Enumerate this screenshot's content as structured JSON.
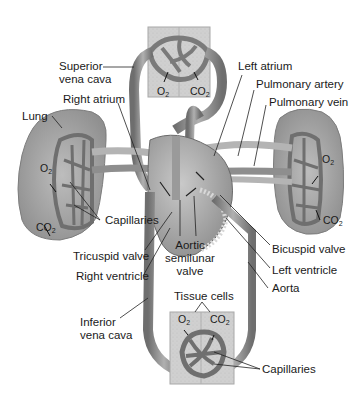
{
  "diagram": {
    "type": "circulatory-system",
    "labels": {
      "superior_vena_cava_1": "Superior",
      "superior_vena_cava_2": "vena cava",
      "right_atrium": "Right atrium",
      "lung": "Lung",
      "capillaries_lung": "Capillaries",
      "tricuspid_valve": "Tricuspid valve",
      "right_ventricle": "Right ventricle",
      "inferior_vena_cava_1": "Inferior",
      "inferior_vena_cava_2": "vena cava",
      "left_atrium": "Left atrium",
      "pulmonary_artery": "Pulmonary artery",
      "pulmonary_vein": "Pulmonary vein",
      "bicuspid_valve": "Bicuspid valve",
      "left_ventricle": "Left ventricle",
      "aorta": "Aorta",
      "aortic_semilunar_1": "Aortic",
      "aortic_semilunar_2": "semilunar",
      "aortic_semilunar_3": "valve",
      "tissue_cells": "Tissue cells",
      "capillaries_tissue": "Capillaries"
    },
    "gases": {
      "o2": "O",
      "co2": "CO",
      "sub": "2"
    },
    "colors": {
      "vessel": "#8a8a8a",
      "vessel_dark": "#5e5e5e",
      "vessel_light": "#b9b9b9",
      "lung": "#9c9c9c",
      "lung_light": "#c4c4c4",
      "tissue": "#d2d2d2",
      "heart": "#a8a8a8",
      "leader": "#222222"
    }
  }
}
